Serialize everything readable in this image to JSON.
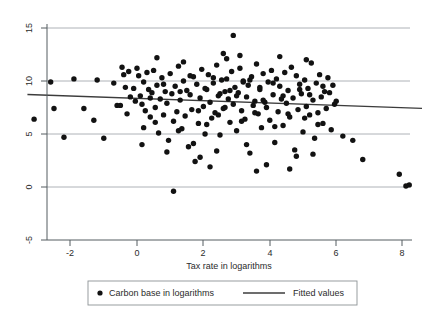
{
  "chart_data": {
    "type": "scatter",
    "title": "",
    "xlabel": "Tax rate in logarithms",
    "ylabel": "",
    "xlim": [
      -3.3,
      8.6
    ],
    "ylim": [
      -5,
      15
    ],
    "xticks": [
      -2,
      0,
      2,
      4,
      6,
      8
    ],
    "xtick_labels": [
      "-2",
      "0",
      "2",
      "4",
      "6",
      "8"
    ],
    "yticks": [
      -5,
      0,
      5,
      10,
      15
    ],
    "ytick_labels": [
      "-5",
      "0",
      "5",
      "10",
      "15"
    ],
    "grid": "horizontal",
    "legend_position": "bottom",
    "series": [
      {
        "name": "Carbon base in logarithms",
        "type": "scatter",
        "marker": "circle",
        "color": "#121212",
        "points": [
          [
            -3.1,
            6.4
          ],
          [
            -2.6,
            9.9
          ],
          [
            -2.5,
            7.4
          ],
          [
            -2.2,
            4.7
          ],
          [
            -1.9,
            10.2
          ],
          [
            -1.6,
            7.4
          ],
          [
            -1.3,
            6.3
          ],
          [
            -1.2,
            10.1
          ],
          [
            -1.0,
            4.6
          ],
          [
            -0.7,
            9.8
          ],
          [
            -0.6,
            7.7
          ],
          [
            -0.5,
            7.7
          ],
          [
            -0.45,
            11.3
          ],
          [
            -0.4,
            10.6
          ],
          [
            -0.35,
            9.4
          ],
          [
            -0.3,
            6.9
          ],
          [
            -0.25,
            10.9
          ],
          [
            -0.2,
            8.5
          ],
          [
            -0.1,
            9.3
          ],
          [
            -0.05,
            8.1
          ],
          [
            0.0,
            11.2
          ],
          [
            0.05,
            10.5
          ],
          [
            0.1,
            8.6
          ],
          [
            0.15,
            7.8
          ],
          [
            0.2,
            9.9
          ],
          [
            0.25,
            7.2
          ],
          [
            0.3,
            10.8
          ],
          [
            0.35,
            9.2
          ],
          [
            0.4,
            6.6
          ],
          [
            0.45,
            8.9
          ],
          [
            0.5,
            11.0
          ],
          [
            0.55,
            7.5
          ],
          [
            0.6,
            9.6
          ],
          [
            0.65,
            5.1
          ],
          [
            0.7,
            8.3
          ],
          [
            0.75,
            10.3
          ],
          [
            0.8,
            6.8
          ],
          [
            0.85,
            9.0
          ],
          [
            0.9,
            7.9
          ],
          [
            0.95,
            4.4
          ],
          [
            1.0,
            10.7
          ],
          [
            1.05,
            8.8
          ],
          [
            1.1,
            6.2
          ],
          [
            1.15,
            9.5
          ],
          [
            1.2,
            7.1
          ],
          [
            1.25,
            11.4
          ],
          [
            1.3,
            8.2
          ],
          [
            1.35,
            5.5
          ],
          [
            1.4,
            10.0
          ],
          [
            1.45,
            6.7
          ],
          [
            1.5,
            9.1
          ],
          [
            1.55,
            3.8
          ],
          [
            1.6,
            8.7
          ],
          [
            1.65,
            7.3
          ],
          [
            1.7,
            10.4
          ],
          [
            1.75,
            2.4
          ],
          [
            1.8,
            9.7
          ],
          [
            1.85,
            6.0
          ],
          [
            1.9,
            8.4
          ],
          [
            1.95,
            11.1
          ],
          [
            2.0,
            7.6
          ],
          [
            2.05,
            9.3
          ],
          [
            2.1,
            5.9
          ],
          [
            2.15,
            10.6
          ],
          [
            2.2,
            8.0
          ],
          [
            2.25,
            6.5
          ],
          [
            2.3,
            9.8
          ],
          [
            2.35,
            7.0
          ],
          [
            2.4,
            11.5
          ],
          [
            2.45,
            8.6
          ],
          [
            2.5,
            4.9
          ],
          [
            2.55,
            10.1
          ],
          [
            2.6,
            7.4
          ],
          [
            2.65,
            9.0
          ],
          [
            2.7,
            12.1
          ],
          [
            2.75,
            8.3
          ],
          [
            2.8,
            6.1
          ],
          [
            2.85,
            10.9
          ],
          [
            2.9,
            7.8
          ],
          [
            2.95,
            9.4
          ],
          [
            3.0,
            5.3
          ],
          [
            3.05,
            8.9
          ],
          [
            3.1,
            11.2
          ],
          [
            3.15,
            7.2
          ],
          [
            3.2,
            10.0
          ],
          [
            3.25,
            6.4
          ],
          [
            3.3,
            8.5
          ],
          [
            3.35,
            9.6
          ],
          [
            3.4,
            3.2
          ],
          [
            3.45,
            10.4
          ],
          [
            3.5,
            7.7
          ],
          [
            3.55,
            8.1
          ],
          [
            3.6,
            11.6
          ],
          [
            3.65,
            6.9
          ],
          [
            3.7,
            9.2
          ],
          [
            3.75,
            5.6
          ],
          [
            3.8,
            10.7
          ],
          [
            3.85,
            8.0
          ],
          [
            3.9,
            7.5
          ],
          [
            3.95,
            9.9
          ],
          [
            4.0,
            6.3
          ],
          [
            4.05,
            11.0
          ],
          [
            4.1,
            8.7
          ],
          [
            4.15,
            4.2
          ],
          [
            4.2,
            10.2
          ],
          [
            4.25,
            7.1
          ],
          [
            4.3,
            9.5
          ],
          [
            4.35,
            8.3
          ],
          [
            4.4,
            5.8
          ],
          [
            4.45,
            10.8
          ],
          [
            4.5,
            7.9
          ],
          [
            4.55,
            9.1
          ],
          [
            4.6,
            6.6
          ],
          [
            4.65,
            11.3
          ],
          [
            4.7,
            8.4
          ],
          [
            4.75,
            3.5
          ],
          [
            4.8,
            10.5
          ],
          [
            4.85,
            7.3
          ],
          [
            4.9,
            9.7
          ],
          [
            4.95,
            8.8
          ],
          [
            5.0,
            5.2
          ],
          [
            5.05,
            10.1
          ],
          [
            5.1,
            7.6
          ],
          [
            5.15,
            9.3
          ],
          [
            5.2,
            6.8
          ],
          [
            5.25,
            11.7
          ],
          [
            5.3,
            8.2
          ],
          [
            5.35,
            4.6
          ],
          [
            5.4,
            9.8
          ],
          [
            5.45,
            7.0
          ],
          [
            5.5,
            10.6
          ],
          [
            5.55,
            8.5
          ],
          [
            5.6,
            6.0
          ],
          [
            5.65,
            9.0
          ],
          [
            5.7,
            7.4
          ],
          [
            5.75,
            10.3
          ],
          [
            5.8,
            8.9
          ],
          [
            5.85,
            5.4
          ],
          [
            5.9,
            9.6
          ],
          [
            5.95,
            7.8
          ],
          [
            6.0,
            8.1
          ],
          [
            6.2,
            4.8
          ],
          [
            6.5,
            4.4
          ],
          [
            6.8,
            2.6
          ],
          [
            7.9,
            1.2
          ],
          [
            8.2,
            0.2
          ],
          [
            8.1,
            0.1
          ],
          [
            1.1,
            -0.4
          ],
          [
            2.9,
            14.3
          ],
          [
            2.6,
            12.6
          ],
          [
            3.1,
            12.4
          ],
          [
            0.6,
            12.2
          ],
          [
            1.4,
            11.8
          ],
          [
            4.3,
            12.3
          ],
          [
            5.1,
            12.0
          ],
          [
            3.9,
            2.1
          ],
          [
            2.2,
            1.9
          ],
          [
            4.6,
            1.7
          ],
          [
            0.2,
            5.6
          ],
          [
            1.7,
            4.1
          ],
          [
            2.4,
            3.4
          ],
          [
            3.3,
            4.0
          ],
          [
            4.8,
            2.9
          ],
          [
            5.3,
            3.1
          ],
          [
            1.9,
            2.8
          ],
          [
            0.9,
            3.3
          ],
          [
            3.6,
            1.5
          ],
          [
            2.7,
            10.2
          ],
          [
            2.8,
            9.1
          ],
          [
            3.0,
            8.6
          ],
          [
            3.2,
            9.9
          ],
          [
            2.5,
            8.8
          ],
          [
            2.3,
            10.3
          ],
          [
            2.1,
            9.2
          ],
          [
            3.4,
            10.1
          ],
          [
            3.7,
            9.4
          ],
          [
            3.8,
            8.2
          ],
          [
            4.1,
            9.8
          ],
          [
            4.4,
            8.6
          ],
          [
            1.3,
            9.0
          ],
          [
            1.6,
            10.5
          ],
          [
            0.8,
            9.7
          ],
          [
            0.4,
            8.4
          ],
          [
            4.9,
            9.2
          ],
          [
            5.2,
            8.7
          ],
          [
            5.6,
            9.5
          ],
          [
            5.05,
            6.5
          ],
          [
            2.05,
            5.0
          ],
          [
            1.25,
            5.3
          ],
          [
            0.15,
            4.0
          ],
          [
            4.15,
            5.7
          ],
          [
            3.15,
            6.2
          ],
          [
            5.45,
            5.9
          ],
          [
            2.45,
            6.8
          ],
          [
            1.85,
            7.2
          ],
          [
            0.55,
            6.1
          ],
          [
            4.55,
            6.9
          ],
          [
            3.55,
            7.0
          ],
          [
            2.65,
            7.5
          ]
        ]
      },
      {
        "name": "Fitted values",
        "type": "line",
        "color": "#3c3c3c",
        "endpoints": [
          [
            -3.3,
            8.72
          ],
          [
            8.6,
            7.42
          ]
        ],
        "slope": -0.109,
        "intercept": 8.36
      }
    ]
  },
  "axes": {
    "x_title": "Tax rate in logarithms",
    "x_tick_labels": [
      "-2",
      "0",
      "2",
      "4",
      "6",
      "8"
    ],
    "y_tick_labels": [
      "15",
      "10",
      "5",
      "0",
      "-5"
    ]
  },
  "legend": {
    "entries": [
      {
        "label": "Carbon base in logarithms",
        "marker": "dot"
      },
      {
        "label": "Fitted values",
        "marker": "line"
      }
    ]
  }
}
